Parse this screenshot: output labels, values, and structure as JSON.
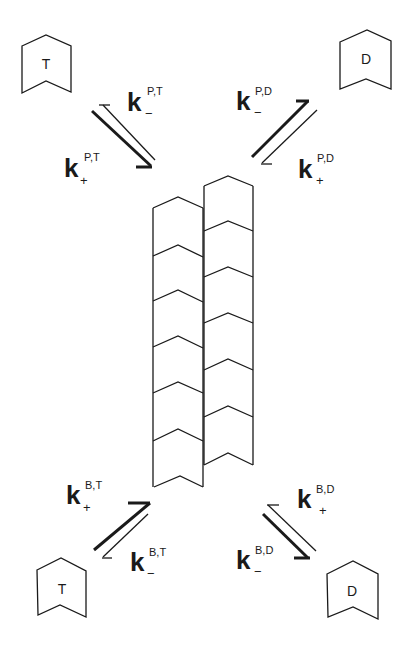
{
  "diagram": {
    "colors": {
      "line": "#1a1a1a",
      "background": "#ffffff"
    },
    "free_subunits": [
      {
        "id": "top-left",
        "label": "T"
      },
      {
        "id": "top-right",
        "label": "D"
      },
      {
        "id": "bottom-left",
        "label": "T"
      },
      {
        "id": "bottom-right",
        "label": "D"
      }
    ],
    "rates": {
      "top_left_minus": {
        "symbol": "k",
        "sup": "P,T",
        "sub": "−"
      },
      "top_left_plus": {
        "symbol": "k",
        "sup": "P,T",
        "sub": "+"
      },
      "top_right_minus": {
        "symbol": "k",
        "sup": "P,D",
        "sub": "−"
      },
      "top_right_plus": {
        "symbol": "k",
        "sup": "P,D",
        "sub": "+"
      },
      "bottom_left_plus": {
        "symbol": "k",
        "sup": "B,T",
        "sub": "+"
      },
      "bottom_left_minus": {
        "symbol": "k",
        "sup": "B,T",
        "sub": "−"
      },
      "bottom_right_plus": {
        "symbol": "k",
        "sup": "B,D",
        "sub": "+"
      },
      "bottom_right_minus": {
        "symbol": "k",
        "sup": "B,D",
        "sub": "−"
      }
    },
    "polymer": {
      "left_column_blocks": 6,
      "right_column_blocks": 6
    }
  }
}
